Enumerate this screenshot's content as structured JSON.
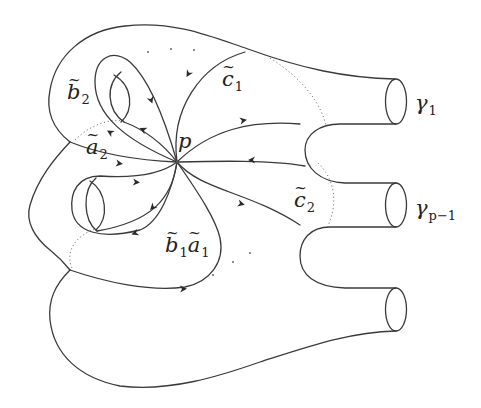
{
  "figure": {
    "base_point": {
      "label": "p"
    },
    "labels": [
      {
        "id": "b2",
        "base": "b",
        "sub": "2",
        "tilde": true
      },
      {
        "id": "a2",
        "base": "a",
        "sub": "2",
        "tilde": true
      },
      {
        "id": "c1",
        "base": "c",
        "sub": "1",
        "tilde": true
      },
      {
        "id": "c2",
        "base": "c",
        "sub": "2",
        "tilde": true
      },
      {
        "id": "b1",
        "base": "b",
        "sub": "1",
        "tilde": true
      },
      {
        "id": "a1",
        "base": "a",
        "sub": "1",
        "tilde": true
      }
    ],
    "boundaries": [
      {
        "id": "gamma1",
        "base": "γ",
        "sub": "1"
      },
      {
        "id": "gammap1",
        "base": "γ",
        "sub": "p−1"
      },
      {
        "id": "gamma_last",
        "base": "",
        "sub": ""
      }
    ],
    "tilde_char": "~"
  },
  "colors": {
    "stroke": "#3a3a3a",
    "background": "#ffffff"
  }
}
